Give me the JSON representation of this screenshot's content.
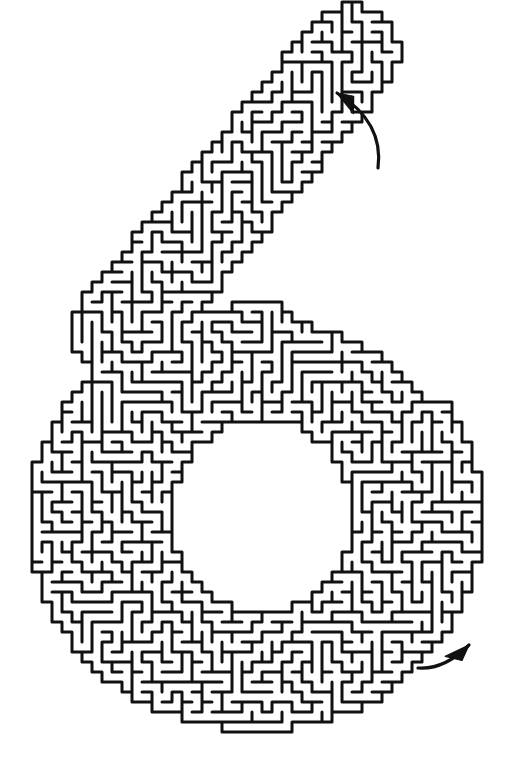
{
  "document": {
    "kind": "maze-puzzle",
    "title": "Number Six Maze",
    "caption": "",
    "background_color": "#ffffff",
    "width": 505,
    "height": 777
  },
  "maze": {
    "shape_character": "6",
    "wall_color": "#111111",
    "wall_thickness": 3.0,
    "cell_size": 10,
    "grid_columns": 50,
    "grid_rows": 77,
    "origin_x": 2,
    "origin_y": 2,
    "random_seed": 20251107,
    "algorithm": "randomized-depth-first-search",
    "passage_color": "#ffffff",
    "border_closed": true,
    "solution_visible": false
  },
  "shape": {
    "description": "digit six: diagonal upper stem sweeping from upper-right down to the left, joined to a large closed lower bowl with a hollow round center",
    "outer_bounds": {
      "left": 28,
      "top": 36,
      "right": 480,
      "bottom": 727
    },
    "stem": {
      "tip_x": 352,
      "tip_y": 52,
      "end_x": 120,
      "end_y": 330,
      "half_width": 47
    },
    "bowl": {
      "center_x": 256,
      "center_y": 518,
      "outer_radius_x": 226,
      "outer_radius_y": 212,
      "inner_radius_x": 92,
      "inner_radius_y": 98,
      "inner_center_x": 262,
      "inner_center_y": 516
    }
  },
  "markers": [
    {
      "name": "entrance-arrow",
      "label": "entrance",
      "x": 348,
      "y": 100,
      "tip_x": 337,
      "tip_y": 93,
      "tail_x": 378,
      "tail_y": 168,
      "curve_x": 384,
      "curve_y": 122,
      "head_size": 17,
      "color": "#111111",
      "direction": "up-left"
    },
    {
      "name": "exit-arrow",
      "label": "exit",
      "x": 424,
      "y": 662,
      "tip_x": 469,
      "tip_y": 645,
      "tail_x": 418,
      "tail_y": 668,
      "curve_x": 444,
      "curve_y": 670,
      "head_size": 17,
      "color": "#111111",
      "direction": "up-right"
    }
  ]
}
